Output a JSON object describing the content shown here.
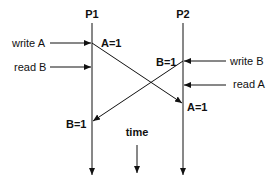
{
  "diagram": {
    "processes": [
      {
        "id": "P1",
        "label": "P1"
      },
      {
        "id": "P2",
        "label": "P2"
      }
    ],
    "events": {
      "p1_write": "write A",
      "p1_read": "read B",
      "p2_write": "write B",
      "p2_read": "read A"
    },
    "messages": {
      "p1_send": "A=1",
      "p2_recv": "A=1",
      "p2_send": "B=1",
      "p1_recv": "B=1"
    },
    "time_label": "time",
    "colors": {
      "line": "#111111",
      "background": "#ffffff"
    }
  }
}
